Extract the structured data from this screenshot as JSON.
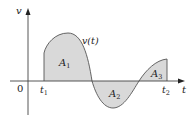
{
  "figure": {
    "y_axis_label": "v",
    "x_axis_label": "t",
    "origin_label": "0",
    "curve_label": "v(t)",
    "t1_label": "t",
    "t1_sub": "1",
    "t2_label": "t",
    "t2_sub": "2",
    "regions": [
      {
        "label": "A",
        "sub": "1"
      },
      {
        "label": "A",
        "sub": "2"
      },
      {
        "label": "A",
        "sub": "3"
      }
    ],
    "colors": {
      "fill": "#d9d9d9",
      "stroke": "#555555",
      "axis": "#444444",
      "text": "#222222"
    }
  }
}
